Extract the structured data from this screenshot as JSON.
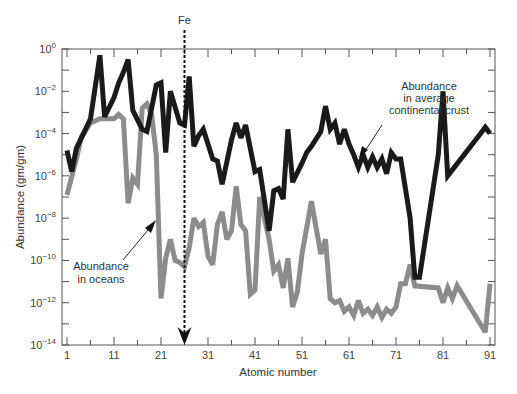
{
  "chart_data": {
    "type": "line",
    "title": "",
    "xlabel": "Atomic number",
    "ylabel": "Abundance (gm/gm)",
    "x_ticks": [
      "1",
      "11",
      "21",
      "31",
      "41",
      "51",
      "61",
      "71",
      "81",
      "91"
    ],
    "y_ticks": [
      "10^0",
      "10^-2",
      "10^-4",
      "10^-6",
      "10^-8",
      "10^-10",
      "10^-12",
      "10^-14"
    ],
    "y_scale": "log",
    "ylim": [
      1e-14,
      1
    ],
    "xlim": [
      1,
      91
    ],
    "grid": false,
    "marker": {
      "label": "Fe",
      "x": 26,
      "style": "dashed vertical arrow"
    },
    "series": [
      {
        "name": "Abundance in average continental crust",
        "color": "#1a1a1a",
        "points_log10": [
          [
            1,
            -4.8
          ],
          [
            2,
            -5.8
          ],
          [
            3,
            -4.7
          ],
          [
            6,
            -3.3
          ],
          [
            8,
            -0.3
          ],
          [
            9,
            -3.2
          ],
          [
            11,
            -2.3
          ],
          [
            12,
            -1.6
          ],
          [
            13,
            -1.1
          ],
          [
            14,
            -0.5
          ],
          [
            15,
            -2.9
          ],
          [
            17,
            -3.8
          ],
          [
            18,
            -3.9
          ],
          [
            20,
            -1.7
          ],
          [
            21,
            -1.6
          ],
          [
            22,
            -4.9
          ],
          [
            23,
            -2.0
          ],
          [
            25,
            -3.5
          ],
          [
            26,
            -3.6
          ],
          [
            27,
            -1.3
          ],
          [
            28,
            -4.6
          ],
          [
            29,
            -4.1
          ],
          [
            30,
            -3.8
          ],
          [
            32,
            -5.2
          ],
          [
            33,
            -5.3
          ],
          [
            34,
            -6.4
          ],
          [
            36,
            -4.3
          ],
          [
            37,
            -3.5
          ],
          [
            38,
            -4.2
          ],
          [
            39,
            -3.6
          ],
          [
            41,
            -5.8
          ],
          [
            42,
            -5.7
          ],
          [
            44,
            -8.6
          ],
          [
            45,
            -6.7
          ],
          [
            46,
            -6.6
          ],
          [
            47,
            -7.1
          ],
          [
            48,
            -3.8
          ],
          [
            49,
            -6.3
          ],
          [
            51,
            -5.4
          ],
          [
            52,
            -4.9
          ],
          [
            53,
            -4.6
          ],
          [
            55,
            -3.9
          ],
          [
            56,
            -2.7
          ],
          [
            57,
            -3.8
          ],
          [
            58,
            -3.5
          ],
          [
            59,
            -4.5
          ],
          [
            60,
            -3.8
          ],
          [
            61,
            -4.5
          ],
          [
            62,
            -5.0
          ],
          [
            63,
            -5.6
          ],
          [
            64,
            -5.0
          ],
          [
            65,
            -5.6
          ],
          [
            66,
            -5.1
          ],
          [
            67,
            -5.6
          ],
          [
            68,
            -5.2
          ],
          [
            69,
            -5.9
          ],
          [
            70,
            -4.9
          ],
          [
            71,
            -5.2
          ],
          [
            72,
            -5.2
          ],
          [
            74,
            -8.0
          ],
          [
            75,
            -10.8
          ],
          [
            76,
            -10.8
          ],
          [
            80,
            -5.0
          ],
          [
            81,
            -2.0
          ],
          [
            82,
            -6.0
          ],
          [
            89,
            -4.0
          ],
          [
            90,
            -3.7
          ],
          [
            91,
            -4.0
          ]
        ]
      },
      {
        "name": "Abundance in oceans",
        "color": "#8c8c8c",
        "points_log10": [
          [
            1,
            -6.9
          ],
          [
            3,
            -5.2
          ],
          [
            4,
            -4.2
          ],
          [
            6,
            -3.5
          ],
          [
            8,
            -3.3
          ],
          [
            11,
            -3.3
          ],
          [
            12,
            -3.1
          ],
          [
            13,
            -3.3
          ],
          [
            14,
            -7.3
          ],
          [
            15,
            -6.1
          ],
          [
            16,
            -6.4
          ],
          [
            17,
            -2.8
          ],
          [
            18,
            -2.6
          ],
          [
            19,
            -3.1
          ],
          [
            20,
            -5.0
          ],
          [
            21,
            -11.8
          ],
          [
            22,
            -9.9
          ],
          [
            23,
            -9.0
          ],
          [
            24,
            -10.0
          ],
          [
            25,
            -10.1
          ],
          [
            26,
            -10.3
          ],
          [
            27,
            -9.4
          ],
          [
            28,
            -8.0
          ],
          [
            29,
            -8.4
          ],
          [
            30,
            -8.2
          ],
          [
            31,
            -9.8
          ],
          [
            32,
            -10.2
          ],
          [
            33,
            -8.3
          ],
          [
            34,
            -7.7
          ],
          [
            35,
            -9.0
          ],
          [
            36,
            -8.6
          ],
          [
            37,
            -6.5
          ],
          [
            38,
            -8.3
          ],
          [
            39,
            -8.6
          ],
          [
            40,
            -11.6
          ],
          [
            41,
            -11.4
          ],
          [
            42,
            -7.0
          ],
          [
            43,
            -8.0
          ],
          [
            44,
            -9.0
          ],
          [
            45,
            -10.5
          ],
          [
            46,
            -10.2
          ],
          [
            47,
            -11.3
          ],
          [
            48,
            -9.9
          ],
          [
            49,
            -12.2
          ],
          [
            50,
            -11.5
          ],
          [
            51,
            -9.7
          ],
          [
            53,
            -7.2
          ],
          [
            55,
            -9.7
          ],
          [
            56,
            -9.0
          ],
          [
            57,
            -11.8
          ],
          [
            58,
            -12.0
          ],
          [
            59,
            -11.9
          ],
          [
            60,
            -12.4
          ],
          [
            61,
            -12.2
          ],
          [
            62,
            -12.6
          ],
          [
            63,
            -11.9
          ],
          [
            64,
            -12.5
          ],
          [
            65,
            -12.3
          ],
          [
            66,
            -12.6
          ],
          [
            67,
            -12.2
          ],
          [
            68,
            -12.7
          ],
          [
            69,
            -12.3
          ],
          [
            70,
            -12.5
          ],
          [
            71,
            -12.2
          ],
          [
            72,
            -11.1
          ],
          [
            73,
            -11.1
          ],
          [
            74,
            -10.2
          ],
          [
            75,
            -11.2
          ],
          [
            80,
            -11.3
          ],
          [
            81,
            -12.0
          ],
          [
            82,
            -11.3
          ],
          [
            83,
            -11.8
          ],
          [
            84,
            -11.2
          ],
          [
            90,
            -13.4
          ],
          [
            91,
            -11.1
          ]
        ]
      }
    ],
    "annotations": [
      {
        "text_lines": [
          "Abundance",
          "in average",
          "continental crust"
        ],
        "points_to": "crust series near Z=60"
      },
      {
        "text_lines": [
          "Abundance",
          "in oceans"
        ],
        "points_to": "ocean series near Z=21"
      }
    ]
  },
  "labels": {
    "fe_marker": "Fe",
    "crust_annotation": [
      "Abundance",
      "in average",
      "continental crust"
    ],
    "ocean_annotation": [
      "Abundance",
      "in oceans"
    ]
  }
}
